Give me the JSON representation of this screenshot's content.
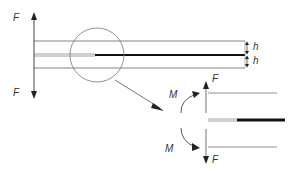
{
  "diagram": {
    "labels": {
      "force_top_left": "F",
      "force_bottom_left": "F",
      "thickness_top": "h",
      "thickness_bottom": "h",
      "moment_top": "M",
      "moment_bottom": "M",
      "force_top_right": "F",
      "force_bottom_right": "F"
    },
    "colors": {
      "line": "#555555",
      "thick_line": "#111111",
      "text": "#333333"
    }
  }
}
